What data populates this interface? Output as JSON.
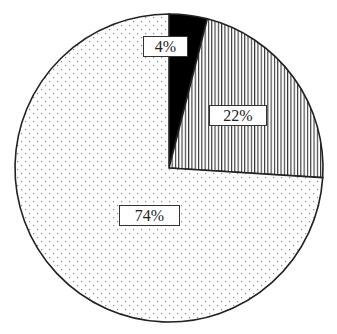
{
  "chart_data": {
    "type": "pie",
    "title": "",
    "start_angle_deg": 0,
    "direction": "clockwise",
    "slices": [
      {
        "label": "4%",
        "value": 4,
        "fill": "solid-black",
        "color": "#000000"
      },
      {
        "label": "22%",
        "value": 22,
        "fill": "vertical-stripes",
        "color": "#333333"
      },
      {
        "label": "74%",
        "value": 74,
        "fill": "dots",
        "color": "#888888"
      }
    ],
    "legend": null
  },
  "labels": {
    "slice0": "4%",
    "slice1": "22%",
    "slice2": "74%"
  },
  "geometry": {
    "cx": 169,
    "cy": 168,
    "r": 154
  }
}
